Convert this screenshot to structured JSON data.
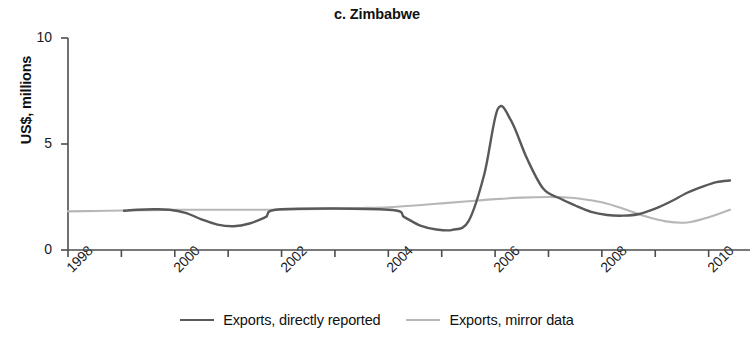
{
  "chart_data": {
    "type": "line",
    "title": "c. Zimbabwe",
    "xlabel": "",
    "ylabel": "US$, millions",
    "xlim": [
      1998,
      2010.4
    ],
    "ylim": [
      0,
      10
    ],
    "yticks": [
      0,
      5,
      10
    ],
    "ytick_labels": [
      "0",
      "5",
      "10"
    ],
    "xticks": [
      1998,
      1999,
      2000,
      2001,
      2002,
      2003,
      2004,
      2005,
      2006,
      2007,
      2008,
      2009,
      2010
    ],
    "xtick_labels_shown": [
      "1998",
      "2000",
      "2002",
      "2004",
      "2006",
      "2008",
      "2010"
    ],
    "grid": false,
    "legend_position": "bottom-center",
    "series": [
      {
        "name": "Exports, directly reported",
        "color": "#595959",
        "x": [
          1999.05,
          1999.3,
          1999.6,
          1999.9,
          2000.2,
          2000.5,
          2000.8,
          2001.1,
          2001.4,
          2001.7,
          2002.0,
          2004.0,
          2004.3,
          2004.6,
          2004.9,
          2005.2,
          2005.5,
          2005.8,
          2006.05,
          2006.3,
          2006.6,
          2006.9,
          2007.2,
          2007.5,
          2007.8,
          2008.1,
          2008.4,
          2008.7,
          2009.0,
          2009.3,
          2009.6,
          2009.9,
          2010.15,
          2010.4
        ],
        "y": [
          1.85,
          1.9,
          1.92,
          1.9,
          1.75,
          1.45,
          1.2,
          1.12,
          1.25,
          1.55,
          1.92,
          1.9,
          1.55,
          1.15,
          0.97,
          0.95,
          1.35,
          3.6,
          6.65,
          6.1,
          4.3,
          2.9,
          2.45,
          2.1,
          1.8,
          1.65,
          1.62,
          1.7,
          1.95,
          2.3,
          2.7,
          3.0,
          3.2,
          3.28
        ]
      },
      {
        "name": "Exports, mirror data",
        "color": "#b7b7b7",
        "x": [
          1998.0,
          1998.5,
          1999.0,
          1999.5,
          2000.0,
          2000.5,
          2001.0,
          2001.5,
          2002.0,
          2002.5,
          2003.0,
          2003.5,
          2004.0,
          2004.5,
          2005.0,
          2005.5,
          2006.0,
          2006.5,
          2007.0,
          2007.3,
          2007.6,
          2008.0,
          2008.4,
          2008.8,
          2009.2,
          2009.6,
          2010.0,
          2010.4
        ],
        "y": [
          1.82,
          1.84,
          1.86,
          1.88,
          1.9,
          1.9,
          1.9,
          1.9,
          1.9,
          1.92,
          1.95,
          1.98,
          2.02,
          2.1,
          2.2,
          2.3,
          2.4,
          2.47,
          2.5,
          2.48,
          2.42,
          2.25,
          1.95,
          1.6,
          1.35,
          1.3,
          1.55,
          1.9
        ]
      }
    ]
  },
  "legend": {
    "items": [
      {
        "label": "Exports, directly reported",
        "color": "#595959"
      },
      {
        "label": "Exports, mirror data",
        "color": "#b7b7b7"
      }
    ]
  },
  "axis": {
    "y_title": "US$, millions"
  }
}
